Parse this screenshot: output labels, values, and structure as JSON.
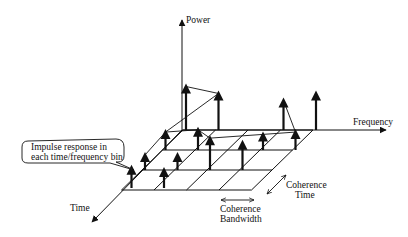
{
  "diagram": {
    "axes": {
      "power": "Power",
      "frequency": "Frequency",
      "time": "Time"
    },
    "callout": {
      "line1": "Impulse response in",
      "line2": "each time/frequency bin"
    },
    "coherence_bandwidth": {
      "line1": "Coherence",
      "line2": "Bandwidth"
    },
    "coherence_time": {
      "line1": "Coherence",
      "line2": "Time"
    },
    "grid": {
      "time_bins": 3,
      "frequency_bins": 4
    },
    "impulses": [
      {
        "t": 0,
        "f": 0,
        "power": 1.0
      },
      {
        "t": 0,
        "f": 1,
        "power": 0.85
      },
      {
        "t": 0,
        "f": 3,
        "power": 0.7
      },
      {
        "t": 0,
        "f": 4,
        "power": 0.85
      },
      {
        "t": 1,
        "f": 0,
        "power": 0.45
      },
      {
        "t": 1,
        "f": 1,
        "power": 0.5
      },
      {
        "t": 1,
        "f": 3,
        "power": 0.4
      },
      {
        "t": 1,
        "f": 4,
        "power": 0.45
      },
      {
        "t": 2,
        "f": 0,
        "power": 0.35
      },
      {
        "t": 2,
        "f": 1,
        "power": 0.35
      },
      {
        "t": 2,
        "f": 2,
        "power": 0.75
      },
      {
        "t": 2,
        "f": 3,
        "power": 0.65
      },
      {
        "t": 3,
        "f": 0,
        "power": 0.5
      },
      {
        "t": 3,
        "f": 1,
        "power": 0.45
      }
    ]
  }
}
